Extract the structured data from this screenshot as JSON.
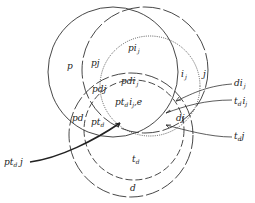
{
  "diagram": {
    "title": "",
    "circles": [
      {
        "id": "p",
        "label": "p",
        "style": "solid",
        "cx": 113,
        "cy": 72,
        "r": 65
      },
      {
        "id": "j",
        "label": "j",
        "style": "long-dash",
        "cx": 145,
        "cy": 70,
        "r": 63
      },
      {
        "id": "i_j",
        "label": "i_j",
        "style": "dotted",
        "cx": 150,
        "cy": 86,
        "r": 50
      },
      {
        "id": "d",
        "label": "d",
        "style": "long-dash",
        "cx": 131,
        "cy": 135,
        "r": 62
      },
      {
        "id": "t_d",
        "label": "t_d",
        "style": "short-dash",
        "cx": 134,
        "cy": 130,
        "r": 50
      }
    ],
    "region_labels": {
      "p": "p",
      "pj": "pj",
      "pi_j_base": "pi",
      "pi_j_sub": "j",
      "i_j_base": "i",
      "i_j_sub": "j",
      "j": "j",
      "pdi_j_base": "pdi",
      "pdi_j_sub": "j",
      "pdj": "pdj",
      "pt_d_i_j_e_base1": "pt",
      "pt_d_i_j_e_sub1": "d",
      "pt_d_i_j_e_base2": "i",
      "pt_d_i_j_e_sub2": "j",
      "pt_d_i_j_e_tail": ",e",
      "pd": "pd",
      "pt_d_base": "pt",
      "pt_d_sub": "d",
      "dj": "dj",
      "t_d_base": "t",
      "t_d_sub": "d",
      "d": "d"
    },
    "callouts": {
      "di_j_base": "di",
      "di_j_sub": "j",
      "t_d_i_j_base1": "t",
      "t_d_i_j_sub1": "d",
      "t_d_i_j_base2": "i",
      "t_d_i_j_sub2": "j",
      "t_d_j_base": "t",
      "t_d_j_sub": "d",
      "t_d_j_tail": "j",
      "pt_d_j_base": "pt",
      "pt_d_j_sub": "d",
      "pt_d_j_tail": " j"
    },
    "colors": {
      "stroke": "#333333",
      "text": "#222222",
      "background": "#ffffff"
    }
  }
}
